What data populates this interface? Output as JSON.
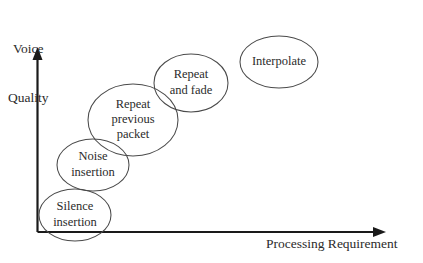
{
  "figure": {
    "background_color": "#ffffff",
    "line_color": "#1a1a1a",
    "bubble_stroke_color": "#4a4a4a",
    "text_color": "#2b2b2b"
  },
  "axes": {
    "y_axis_label_line1": "Voice",
    "y_axis_label_line2": "Quality",
    "x_axis_label": "Processing Requirement"
  },
  "chart_data": {
    "type": "scatter",
    "title": "",
    "xlabel": "Processing Requirement",
    "ylabel": "Voice Quality",
    "grid": false,
    "legend": "none",
    "xlim": [
      0,
      100
    ],
    "ylim": [
      0,
      100
    ],
    "annotation_style": "labelled ellipses, monotonically increasing trend",
    "points": [
      {
        "label": "Silence insertion",
        "label_lines": [
          "Silence",
          "insertion"
        ],
        "x": 12,
        "y": 8,
        "cx": 75,
        "cy": 215,
        "rx": 36,
        "ry": 26,
        "font_size": 12.5
      },
      {
        "label": "Noise insertion",
        "label_lines": [
          "Noise",
          "insertion"
        ],
        "x": 22,
        "y": 26,
        "cx": 93,
        "cy": 165,
        "rx": 36,
        "ry": 26,
        "font_size": 12.5
      },
      {
        "label": "Repeat previous packet",
        "label_lines": [
          "Repeat",
          "previous",
          "packet"
        ],
        "x": 36,
        "y": 47,
        "cx": 133,
        "cy": 120,
        "rx": 45,
        "ry": 36,
        "font_size": 12.5
      },
      {
        "label": "Repeat and fade",
        "label_lines": [
          "Repeat",
          "and fade"
        ],
        "x": 55,
        "y": 68,
        "cx": 191,
        "cy": 83,
        "rx": 37,
        "ry": 29,
        "font_size": 12.5
      },
      {
        "label": "Interpolate",
        "label_lines": [
          "Interpolate"
        ],
        "x": 76,
        "y": 85,
        "cx": 279,
        "cy": 62,
        "rx": 39,
        "ry": 26,
        "font_size": 12.5
      }
    ]
  }
}
